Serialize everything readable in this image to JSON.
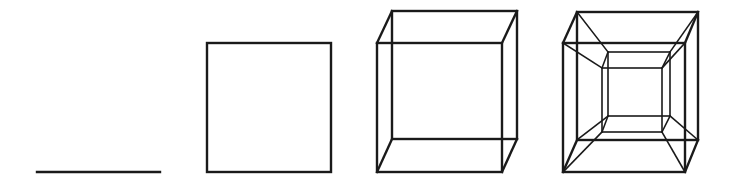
{
  "diagram": {
    "stroke_color": "#1a1a1a",
    "background": "#ffffff",
    "figures": [
      {
        "name": "line-segment",
        "dimension": 1
      },
      {
        "name": "square",
        "dimension": 2
      },
      {
        "name": "cube",
        "dimension": 3
      },
      {
        "name": "tesseract",
        "dimension": 4
      }
    ]
  }
}
